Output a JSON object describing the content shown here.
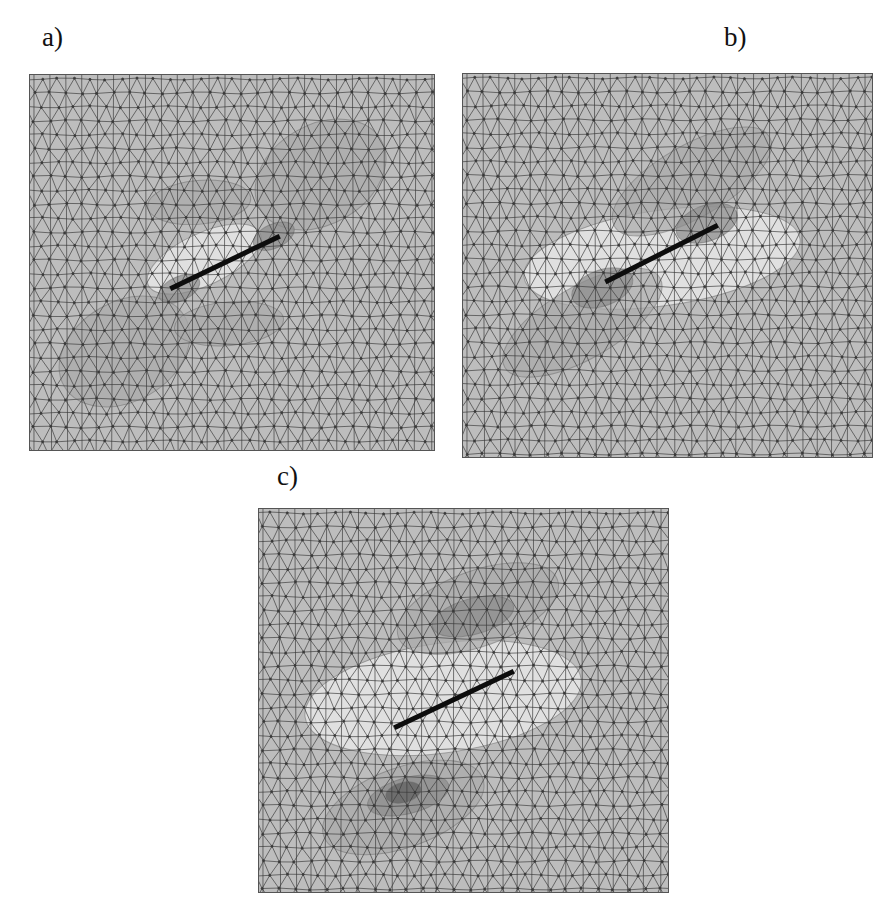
{
  "figure": {
    "background": "#ffffff",
    "mesh_color": "#3a3a3a",
    "base_fill": "#bdbdbd",
    "crack_color": "#0d0d0d",
    "panels": [
      {
        "id": "a",
        "label": "a)",
        "label_pos": [
          42,
          24
        ],
        "box": [
          29,
          74,
          406,
          377
        ],
        "crack": [
          [
            141,
            215
          ],
          [
            251,
            162
          ]
        ],
        "regions": [
          {
            "tone": "light",
            "cx": 175,
            "cy": 185,
            "rx": 62,
            "ry": 26,
            "rot": -25
          },
          {
            "tone": "mid",
            "cx": 292,
            "cy": 100,
            "rx": 70,
            "ry": 50,
            "rot": -30
          },
          {
            "tone": "mid",
            "cx": 95,
            "cy": 278,
            "rx": 70,
            "ry": 50,
            "rot": -30
          },
          {
            "tone": "mid",
            "cx": 170,
            "cy": 128,
            "rx": 52,
            "ry": 22,
            "rot": -5
          },
          {
            "tone": "mid",
            "cx": 200,
            "cy": 250,
            "rx": 55,
            "ry": 22,
            "rot": -5
          },
          {
            "tone": "dark",
            "cx": 245,
            "cy": 162,
            "rx": 22,
            "ry": 12,
            "rot": -25
          },
          {
            "tone": "dark",
            "cx": 150,
            "cy": 215,
            "rx": 22,
            "ry": 12,
            "rot": -25
          }
        ]
      },
      {
        "id": "b",
        "label": "b)",
        "label_pos": [
          724,
          24
        ],
        "box": [
          462,
          73,
          411,
          385
        ],
        "crack": [
          [
            143,
            209
          ],
          [
            256,
            152
          ]
        ],
        "regions": [
          {
            "tone": "light",
            "cx": 200,
            "cy": 185,
            "rx": 140,
            "ry": 48,
            "rot": -8
          },
          {
            "tone": "mid",
            "cx": 230,
            "cy": 108,
            "rx": 90,
            "ry": 36,
            "rot": -30
          },
          {
            "tone": "mid",
            "cx": 120,
            "cy": 250,
            "rx": 90,
            "ry": 36,
            "rot": -30
          },
          {
            "tone": "dark",
            "cx": 245,
            "cy": 150,
            "rx": 32,
            "ry": 18,
            "rot": -20
          },
          {
            "tone": "dark",
            "cx": 140,
            "cy": 215,
            "rx": 32,
            "ry": 18,
            "rot": -20
          }
        ]
      },
      {
        "id": "c",
        "label": "c)",
        "label_pos": [
          277,
          463
        ],
        "box": [
          258,
          508,
          411,
          385
        ],
        "crack": [
          [
            136,
            220
          ],
          [
            256,
            163
          ]
        ],
        "regions": [
          {
            "tone": "light",
            "cx": 185,
            "cy": 190,
            "rx": 140,
            "ry": 55,
            "rot": -8
          },
          {
            "tone": "mid",
            "cx": 220,
            "cy": 100,
            "rx": 85,
            "ry": 38,
            "rot": -20
          },
          {
            "tone": "mid",
            "cx": 145,
            "cy": 300,
            "rx": 85,
            "ry": 40,
            "rot": -20
          },
          {
            "tone": "dark",
            "cx": 215,
            "cy": 108,
            "rx": 42,
            "ry": 18,
            "rot": -15
          },
          {
            "tone": "dark",
            "cx": 150,
            "cy": 288,
            "rx": 42,
            "ry": 18,
            "rot": -15
          },
          {
            "tone": "darkest",
            "cx": 145,
            "cy": 285,
            "rx": 18,
            "ry": 10,
            "rot": -15
          }
        ]
      }
    ],
    "tones": {
      "light": "#e6e6e6",
      "mid": "#a9a9a9",
      "dark": "#8a8a8a",
      "darkest": "#5e5e5e"
    },
    "mesh": {
      "dx": 16,
      "dy": 14
    }
  }
}
